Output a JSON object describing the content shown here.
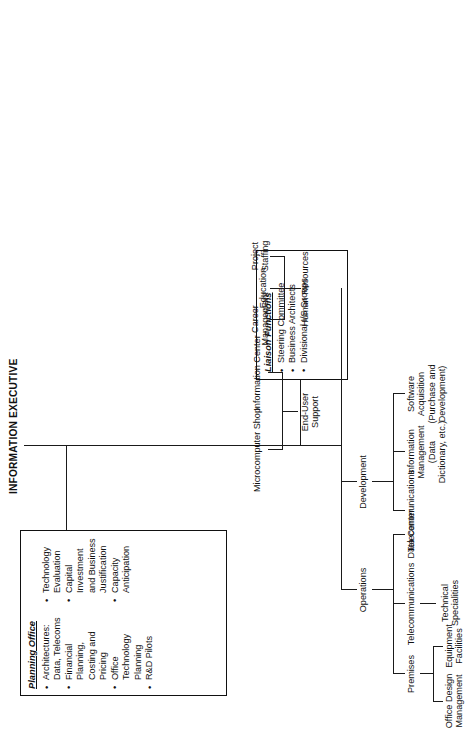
{
  "chart_data": {
    "type": "diagram",
    "title": "INFORMATION EXECUTIVE",
    "orientation": "rotated-90-ccw",
    "root": "INFORMATION EXECUTIVE",
    "boxes": [
      {
        "name": "planning-office",
        "title": "Planning Office",
        "items": [
          "Architectures: Data, Telecoms",
          "Financial Planning, Costing and Pricing",
          "Office Technology Planning",
          "R&D Pilots",
          "Technology Evaluation",
          "Capital Investment and Business\nJustification",
          "Capacity Anticipation"
        ],
        "column_split": 4
      },
      {
        "name": "liaison-functions",
        "title": "Liaison Functions",
        "items": [
          "Steering Committee",
          "Business Architects",
          "Divisional I/S Groups"
        ]
      }
    ],
    "branches": [
      {
        "label": "Operations",
        "children": [
          {
            "label": "Premises",
            "children": [
              {
                "label": "Office Design\nManagement"
              },
              {
                "label": "Equipment\nFacilities"
              }
            ]
          },
          {
            "label": "Telecommunications",
            "children": [
              {
                "label": "Technical\nSpecialities"
              }
            ]
          },
          {
            "label": "Data Center"
          }
        ]
      },
      {
        "label": "Development",
        "children": [
          {
            "label": "Telecommunications"
          },
          {
            "label": "Information\nManagement\n(Data\nDictionary, etc.)"
          },
          {
            "label": "Software\nAcquisition\n(Purchase and\nDevelopment)"
          }
        ]
      },
      {
        "label": "End-User\nSupport",
        "children": [
          {
            "label": "Microcomputer Shop"
          },
          {
            "label": "Information Center"
          }
        ]
      },
      {
        "label": "Human Resources",
        "children": [
          {
            "label": "Career\nManagement"
          },
          {
            "label": "Education"
          },
          {
            "label": "Project\nStaffing"
          }
        ]
      }
    ]
  },
  "diagram": {
    "title": "INFORMATION EXECUTIVE",
    "planning": {
      "title": "Planning Office",
      "i0": "Architectures: Data, Telecoms",
      "i1": "Financial Planning, Costing and Pricing",
      "i2": "Office Technology Planning",
      "i3": "R&D Pilots",
      "i4": "Technology Evaluation",
      "i5": "Capital Investment and Business\nJustification",
      "i6": "Capacity Anticipation"
    },
    "liaison": {
      "title": "Liaison Functions",
      "i0": "Steering Committee",
      "i1": "Business Architects",
      "i2": "Divisional I/S Groups"
    },
    "operations": "Operations",
    "premises": "Premises",
    "office_design": "Office Design\nManagement",
    "equipment": "Equipment\nFacilities",
    "ops_telecom": "Telecommunications",
    "tech_spec": "Technical\nSpecialities",
    "data_center": "Data Center",
    "development": "Development",
    "dev_telecom": "Telecommunications",
    "info_mgmt": "Information\nManagement\n(Data\nDictionary, etc.)",
    "software_acq": "Software\nAcquisition\n(Purchase and\nDevelopment)",
    "end_user": "End-User\nSupport",
    "micro_shop": "Microcomputer Shop",
    "info_center": "Information Center",
    "human_resources": "Human Resources",
    "career_mgmt": "Career\nManagement",
    "education": "Education",
    "project_staffing": "Project\nStaffing"
  }
}
